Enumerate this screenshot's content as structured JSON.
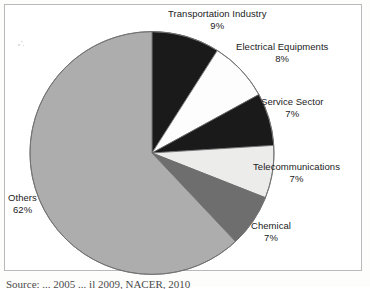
{
  "figure": {
    "caption": "Source: ... 2005 ... il 2009, NACER, 2010",
    "frame_color": "#b9b9b9"
  },
  "chart_data": {
    "type": "pie",
    "title": "",
    "start_angle_deg": 0,
    "direction": "clockwise",
    "total": 100,
    "units": "%",
    "legend": "none-labels-outside",
    "categories": [
      "Transportation Industry",
      "Electrical Equipments",
      "Service Sector",
      "Telecommunications",
      "Chemical",
      "Others"
    ],
    "values": [
      9,
      8,
      7,
      7,
      7,
      62
    ],
    "value_labels": [
      "9%",
      "8%",
      "7%",
      "7%",
      "7%",
      "62%"
    ],
    "colors": [
      "#1a1a1a",
      "#fdfdfd",
      "#1a1a1a",
      "#ececeb",
      "#6e6e6e",
      "#adadad"
    ],
    "slices": [
      {
        "label": "Transportation Industry",
        "value": 9,
        "value_label": "9%",
        "color": "#1a1a1a"
      },
      {
        "label": "Electrical Equipments",
        "value": 8,
        "value_label": "8%",
        "color": "#fdfdfd"
      },
      {
        "label": "Service Sector",
        "value": 7,
        "value_label": "7%",
        "color": "#1a1a1a"
      },
      {
        "label": "Telecommunications",
        "value": 7,
        "value_label": "7%",
        "color": "#ececeb"
      },
      {
        "label": "Chemical",
        "value": 7,
        "value_label": "7%",
        "color": "#6e6e6e"
      },
      {
        "label": "Others",
        "value": 62,
        "value_label": "62%",
        "color": "#adadad"
      }
    ],
    "geometry": {
      "cx": 152,
      "cy": 153,
      "r": 122
    }
  }
}
